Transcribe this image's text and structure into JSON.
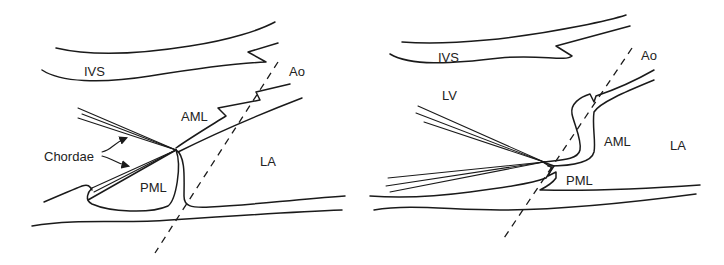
{
  "panels": [
    {
      "id": "left",
      "labels": {
        "ivs": "IVS",
        "ao": "Ao",
        "aml": "AML",
        "chordae": "Chordae",
        "la": "LA",
        "pml": "PML"
      }
    },
    {
      "id": "right",
      "labels": {
        "ivs": "IVS",
        "ao": "Ao",
        "lv": "LV",
        "aml": "AML",
        "la": "LA",
        "pml": "PML"
      }
    }
  ],
  "colors": {
    "stroke": "#1a1a1a",
    "text": "#222222",
    "background": "#ffffff"
  }
}
